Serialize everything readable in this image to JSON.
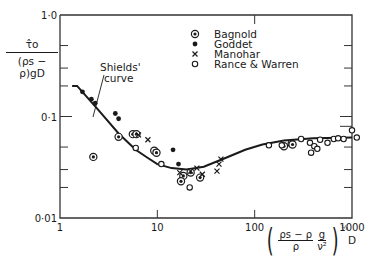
{
  "chart_data": {
    "type": "scatter",
    "title": "",
    "xscale": "log",
    "yscale": "log",
    "xlim": [
      1,
      1000
    ],
    "ylim": [
      0.01,
      1.0
    ],
    "x_ticks": [
      "1",
      "10",
      "100",
      "1000"
    ],
    "y_ticks": [
      "0·01",
      "0·1",
      "1·0"
    ],
    "ylabel": {
      "numerator": "τ̂o",
      "denominator": "(ρs − ρ)gD"
    },
    "xlabel": {
      "frac1_num": "ρs − ρ",
      "frac1_den": "ρ",
      "frac2_num": "g",
      "frac2_den": "ν²",
      "exponent": "⅓",
      "suffix": "D"
    },
    "grid": false,
    "legend_position": "upper right (inside)",
    "legend": [
      {
        "name": "Bagnold",
        "marker": "circled-dot"
      },
      {
        "name": "Goddet",
        "marker": "filled-dot"
      },
      {
        "name": "Manohar",
        "marker": "cross"
      },
      {
        "name": "Rance & Warren",
        "marker": "open-circle"
      }
    ],
    "annotation": {
      "text_line1": "Shields'",
      "text_line2": "curve"
    },
    "curve": {
      "name": "Shields' curve",
      "x": [
        1.5,
        2.5,
        4,
        6,
        8,
        10,
        14,
        20,
        30,
        50,
        80,
        120,
        200,
        400,
        1000
      ],
      "y": [
        0.2,
        0.115,
        0.068,
        0.047,
        0.039,
        0.034,
        0.031,
        0.03,
        0.032,
        0.039,
        0.047,
        0.053,
        0.058,
        0.061,
        0.062
      ]
    },
    "series": [
      {
        "name": "Bagnold",
        "x": [
          2.2,
          4.0,
          5.6,
          6.1,
          9.3,
          9.8,
          18.5,
          22.0,
          27.5,
          17.5,
          200,
          240,
          245
        ],
        "y": [
          0.04,
          0.063,
          0.067,
          0.067,
          0.046,
          0.044,
          0.026,
          0.028,
          0.025,
          0.023,
          0.051,
          0.054,
          0.053
        ]
      },
      {
        "name": "Goddet",
        "x": [
          1.7,
          2.1,
          2.3,
          3.7,
          4.0,
          14.5,
          16.5
        ],
        "y": [
          0.175,
          0.148,
          0.135,
          0.107,
          0.095,
          0.047,
          0.034
        ]
      },
      {
        "name": "Manohar",
        "x": [
          6.4,
          8.0,
          17.0,
          22.0,
          25.5,
          29.0,
          45.0,
          43.0,
          41.0
        ],
        "y": [
          0.066,
          0.059,
          0.028,
          0.029,
          0.031,
          0.027,
          0.038,
          0.034,
          0.029
        ]
      },
      {
        "name": "Rance & Warren",
        "x": [
          6.0,
          11.0,
          21.5,
          140,
          190,
          300,
          370,
          470,
          410,
          380,
          440,
          560,
          650,
          720,
          820,
          1000,
          1120
        ],
        "y": [
          0.049,
          0.034,
          0.02,
          0.052,
          0.052,
          0.06,
          0.055,
          0.059,
          0.051,
          0.044,
          0.048,
          0.055,
          0.06,
          0.061,
          0.06,
          0.073,
          0.062
        ]
      }
    ]
  },
  "layout": {
    "plot_left": 60,
    "plot_right": 352,
    "plot_top": 15,
    "plot_bottom": 218,
    "ink_color": "#1a1a1a",
    "axis_color": "#333333",
    "background": "#ffffff"
  }
}
